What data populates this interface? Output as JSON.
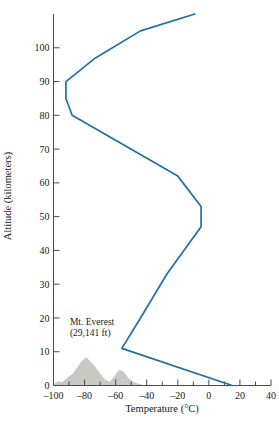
{
  "chart_data": {
    "type": "line",
    "title": "",
    "xlabel": "Temperature (°C)",
    "ylabel": "Altitude (kilometers)",
    "xlim": [
      -100,
      40
    ],
    "ylim": [
      0,
      110
    ],
    "xticks": [
      -100,
      -90,
      -80,
      -70,
      -60,
      -50,
      -40,
      -30,
      -20,
      -10,
      0,
      10,
      20,
      30,
      40
    ],
    "xticklabels": [
      "–100",
      "",
      "–80",
      "",
      "–60",
      "",
      "–40",
      "",
      "–20",
      "",
      "0",
      "",
      "20",
      "",
      "40"
    ],
    "yticks": [
      0,
      10,
      20,
      30,
      40,
      50,
      60,
      70,
      80,
      90,
      100
    ],
    "yticklabels": [
      "0",
      "10",
      "20",
      "30",
      "40",
      "50",
      "60",
      "70",
      "80",
      "90",
      "100"
    ],
    "grid": false,
    "legend": false,
    "series": [
      {
        "name": "Atmospheric temperature profile",
        "color": "#1f6fa8",
        "points": [
          {
            "t": 15,
            "z": 0
          },
          {
            "t": -56,
            "z": 11
          },
          {
            "t": -44,
            "z": 20
          },
          {
            "t": -27,
            "z": 33
          },
          {
            "t": -5,
            "z": 47
          },
          {
            "t": -5,
            "z": 53
          },
          {
            "t": -20,
            "z": 62
          },
          {
            "t": -88,
            "z": 80
          },
          {
            "t": -92,
            "z": 85
          },
          {
            "t": -92,
            "z": 90
          },
          {
            "t": -73,
            "z": 97
          },
          {
            "t": -44,
            "z": 105
          },
          {
            "t": -9,
            "z": 110
          }
        ]
      }
    ],
    "annotations": [
      {
        "name": "mount-everest-label",
        "line1": "Mt. Everest",
        "line2": "(29,141 ft)",
        "t": -92,
        "z": 18
      }
    ],
    "terrain": {
      "name": "mountain-silhouette",
      "fill": "#c9c9c4",
      "profile": [
        {
          "t": -100,
          "z": 0.4
        },
        {
          "t": -97,
          "z": 1.2
        },
        {
          "t": -94,
          "z": 1.0
        },
        {
          "t": -91,
          "z": 2.4
        },
        {
          "t": -88,
          "z": 3.3
        },
        {
          "t": -85,
          "z": 5.2
        },
        {
          "t": -82,
          "z": 7.2
        },
        {
          "t": -79,
          "z": 8.4
        },
        {
          "t": -76,
          "z": 7.0
        },
        {
          "t": -73,
          "z": 5.4
        },
        {
          "t": -70,
          "z": 3.6
        },
        {
          "t": -67,
          "z": 1.8
        },
        {
          "t": -64,
          "z": 1.1
        },
        {
          "t": -61,
          "z": 2.6
        },
        {
          "t": -58,
          "z": 4.6
        },
        {
          "t": -55,
          "z": 4.2
        },
        {
          "t": -52,
          "z": 2.4
        },
        {
          "t": -49,
          "z": 1.2
        },
        {
          "t": -46,
          "z": 0.6
        },
        {
          "t": -43,
          "z": 0.3
        }
      ]
    }
  }
}
